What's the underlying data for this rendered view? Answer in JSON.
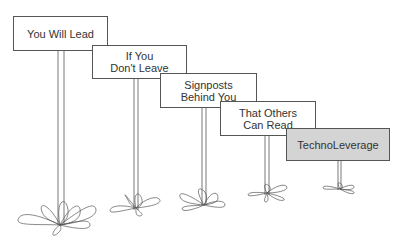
{
  "diagram": {
    "type": "signposts",
    "signs": [
      {
        "label": "You Will Lead",
        "highlight": false
      },
      {
        "label": "If You\nDon't Leave",
        "highlight": false
      },
      {
        "label": "Signposts\nBehind You",
        "highlight": false
      },
      {
        "label": "That Others\nCan Read",
        "highlight": false
      },
      {
        "label": "TechnoLeverage",
        "highlight": true
      }
    ],
    "colors": {
      "line": "#555555",
      "highlight_fill": "#d4d4d4",
      "fill": "#ffffff"
    }
  }
}
